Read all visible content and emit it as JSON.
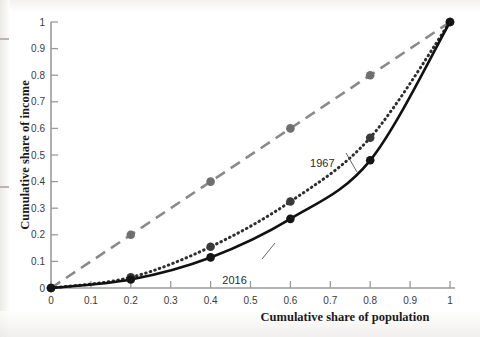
{
  "chart_data": {
    "type": "line",
    "title": "",
    "xlabel": "Cumulative share of population",
    "ylabel": "Cumulative share of income",
    "xlim": [
      0,
      1
    ],
    "ylim": [
      0,
      1
    ],
    "grid": false,
    "legend_position": "inline-annotations",
    "x_ticks": [
      "0",
      "0.1",
      "0.2",
      "0.3",
      "0.4",
      "0.5",
      "0.6",
      "0.7",
      "0.8",
      "0.9",
      "1"
    ],
    "y_ticks": [
      "0",
      "0.1",
      "0.2",
      "0.3",
      "0.4",
      "0.5",
      "0.6",
      "0.7",
      "0.8",
      "0.9",
      "1"
    ],
    "x_tick_values": [
      0,
      0.1,
      0.2,
      0.3,
      0.4,
      0.5,
      0.6,
      0.7,
      0.8,
      0.9,
      1
    ],
    "y_tick_values": [
      0,
      0.1,
      0.2,
      0.3,
      0.4,
      0.5,
      0.6,
      0.7,
      0.8,
      0.9,
      1
    ],
    "x": [
      0,
      0.2,
      0.4,
      0.6,
      0.8,
      1
    ],
    "series": [
      {
        "name": "line-of-equality",
        "label": "",
        "style": "dashed",
        "color": "#8a8a8a",
        "marker": "circle",
        "marker_color": "#6f6f6f",
        "values": [
          0,
          0.2,
          0.4,
          0.6,
          0.8,
          1
        ]
      },
      {
        "name": "1967",
        "label": "1967",
        "style": "dotted",
        "color": "#2e2e2e",
        "marker": "circle",
        "marker_color": "#3a3a3a",
        "values": [
          0,
          0.04,
          0.155,
          0.325,
          0.565,
          1
        ]
      },
      {
        "name": "2016",
        "label": "2016",
        "style": "solid",
        "color": "#111111",
        "marker": "circle",
        "marker_color": "#151515",
        "values": [
          0,
          0.032,
          0.115,
          0.26,
          0.48,
          1
        ]
      }
    ],
    "annotations": [
      {
        "name": "label-1967",
        "text": "1967",
        "x": 0.68,
        "y": 0.455
      },
      {
        "name": "label-2016",
        "text": "2016",
        "x": 0.46,
        "y": 0.015
      }
    ]
  },
  "artifacts": {
    "ghost_line_1": "",
    "ghost_line_2": ""
  }
}
